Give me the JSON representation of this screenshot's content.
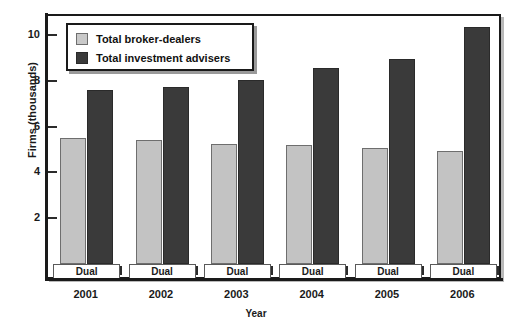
{
  "chart_data": {
    "type": "bar",
    "title": "",
    "xlabel": "Year",
    "ylabel": "Firms (thousands)",
    "categories": [
      "2001",
      "2002",
      "2003",
      "2004",
      "2005",
      "2006"
    ],
    "ylim": [
      0,
      10.9
    ],
    "yticks": [
      2,
      4,
      6,
      8,
      10
    ],
    "ytick_labels": [
      "2",
      "4",
      "6",
      "8",
      "10"
    ],
    "grid": false,
    "legend_position": "top-left",
    "group_label": "Dual",
    "group_labels": [
      "Dual",
      "Dual",
      "Dual",
      "Dual",
      "Dual",
      "Dual"
    ],
    "series": [
      {
        "name": "Total broker-dealers",
        "color": "#c3c3c3",
        "values": [
          5.5,
          5.4,
          5.25,
          5.2,
          5.05,
          4.95
        ]
      },
      {
        "name": "Total investment advisers",
        "color": "#3a3a3a",
        "values": [
          7.6,
          7.75,
          8.05,
          8.55,
          8.95,
          10.35
        ]
      }
    ]
  },
  "legend": {
    "items": [
      {
        "label": "Total broker-dealers",
        "swatch": "light"
      },
      {
        "label": "Total investment advisers",
        "swatch": "dark"
      }
    ]
  },
  "axes": {
    "y_title": "Firms (thousands)",
    "x_title": "Year"
  }
}
